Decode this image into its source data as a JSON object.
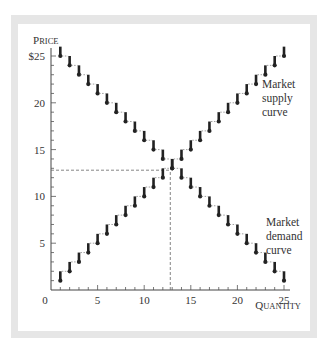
{
  "chart_data": {
    "type": "line",
    "title": "",
    "xlabel": "Quantity",
    "ylabel": "Price",
    "xlim": [
      0,
      25
    ],
    "ylim": [
      0,
      25
    ],
    "x_ticks": [
      0,
      5,
      10,
      15,
      20,
      25
    ],
    "y_ticks": [
      5,
      10,
      15,
      20,
      25
    ],
    "y_tick_labels": [
      "5",
      "10",
      "15",
      "20",
      "$25"
    ],
    "x_tick_labels": [
      "0",
      "5",
      "10",
      "15",
      "20",
      "25"
    ],
    "minor_ticks_every": 1,
    "grid": false,
    "step_style": true,
    "series": [
      {
        "name": "Market supply curve",
        "label_lines": [
          "Market",
          "supply",
          "curve"
        ],
        "x": [
          1,
          2,
          3,
          4,
          5,
          6,
          7,
          8,
          9,
          10,
          11,
          12,
          13,
          14,
          15,
          16,
          17,
          18,
          19,
          20,
          21,
          22,
          23,
          24,
          25
        ],
        "y": [
          1,
          2,
          3,
          4,
          5,
          6,
          7,
          8,
          9,
          10,
          11,
          12,
          13,
          14,
          15,
          16,
          17,
          18,
          19,
          20,
          21,
          22,
          23,
          24,
          25
        ]
      },
      {
        "name": "Market demand curve",
        "label_lines": [
          "Market",
          "demand",
          "curve"
        ],
        "x": [
          1,
          2,
          3,
          4,
          5,
          6,
          7,
          8,
          9,
          10,
          11,
          12,
          13,
          14,
          15,
          16,
          17,
          18,
          19,
          20,
          21,
          22,
          23,
          24,
          25
        ],
        "y": [
          25,
          24,
          23,
          22,
          21,
          20,
          19,
          18,
          17,
          16,
          15,
          14,
          13,
          12,
          11,
          10,
          9,
          8,
          7,
          6,
          5,
          4,
          3,
          2,
          1
        ]
      }
    ],
    "annotations": [
      {
        "type": "dashed-hline",
        "y": 12.8,
        "x_from": 0,
        "x_to": 12.8
      },
      {
        "type": "dashed-vline",
        "x": 12.8,
        "y_from": 0,
        "y_to": 12.8
      }
    ],
    "equilibrium": {
      "quantity": 12.8,
      "price": 12.8
    }
  },
  "colors": {
    "frame": "#e6e6e6",
    "ink": "#222222",
    "text": "#333333"
  }
}
